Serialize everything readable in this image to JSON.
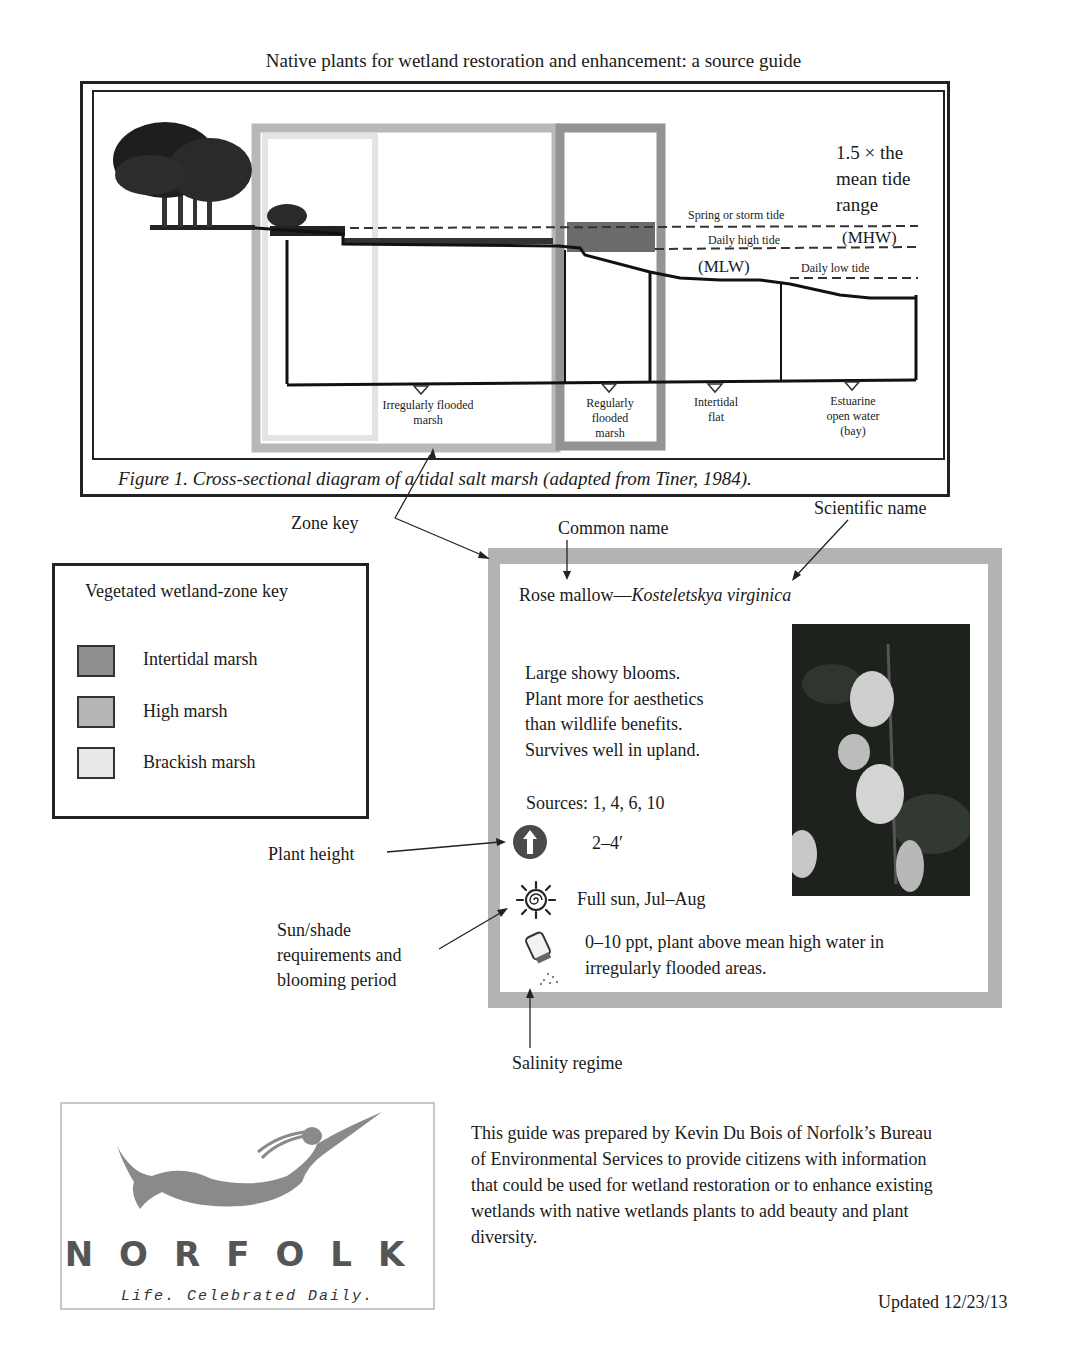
{
  "page": {
    "title": "Native plants for wetland restoration and enhancement: a source guide"
  },
  "figure": {
    "caption": "Figure 1. Cross-sectional diagram of a tidal salt marsh (adapted from Tiner, 1984).",
    "tide_range_note": [
      "1.5 × the",
      "mean tide",
      "range"
    ],
    "tide_lines": {
      "spring": "Spring or storm tide",
      "daily_high": "Daily high tide",
      "mhw": "(MHW)",
      "mlw": "(MLW)",
      "daily_low": "Daily low tide"
    },
    "zones": [
      {
        "label": [
          "Irregularly flooded",
          "marsh"
        ]
      },
      {
        "label": [
          "Regularly",
          "flooded",
          "marsh"
        ]
      },
      {
        "label": [
          "Intertidal",
          "flat"
        ]
      },
      {
        "label": [
          "Estuarine",
          "open water",
          "(bay)"
        ]
      }
    ],
    "zone_colors": {
      "intertidal": "#8c8c8c",
      "high": "#b4b4b4",
      "brackish": "#e6e6e6"
    }
  },
  "annotations": {
    "zone_key": "Zone key",
    "common_name": "Common name",
    "scientific_name": "Scientific name",
    "plant_height": "Plant height",
    "sun_shade": [
      "Sun/shade",
      "requirements and",
      "blooming period"
    ],
    "salinity": "Salinity regime"
  },
  "zone_key": {
    "title": "Vegetated wetland-zone key",
    "items": [
      {
        "label": "Intertidal marsh",
        "color": "#8f8f8f"
      },
      {
        "label": "High marsh",
        "color": "#b5b5b5"
      },
      {
        "label": "Brackish marsh",
        "color": "#e8e8e8"
      }
    ]
  },
  "plant_card": {
    "common_name": "Rose mallow",
    "separator": "—",
    "scientific_name": "Kosteletskya virginica",
    "description": [
      "Large showy blooms.",
      "Plant more for aesthetics",
      "than wildlife benefits.",
      "Survives well in upland."
    ],
    "sources": "Sources: 1, 4, 6, 10",
    "height": "2–4′",
    "sun": "Full sun, Jul–Aug",
    "salinity": [
      "0–10 ppt, plant above mean high water in",
      "irregularly flooded areas."
    ],
    "border_color": "#b3b3b3"
  },
  "footer": {
    "logo_word": "NORFOLK",
    "logo_tagline": "Life. Celebrated Daily.",
    "about": "This guide was prepared by Kevin Du Bois of Norfolk’s Bureau of Environmental Services to provide citizens with information that could be used for wetland restoration or to enhance existing wetlands with native wetlands plants to add beauty and plant diversity.",
    "updated": "Updated 12/23/13"
  }
}
